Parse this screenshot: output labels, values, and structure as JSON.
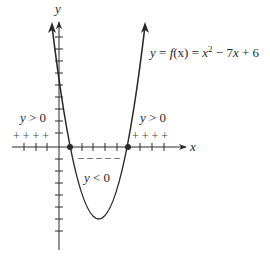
{
  "diagram": {
    "type": "parabola-sign-chart",
    "equation_label": "y = f(x) = x² − 7x + 6",
    "function": {
      "a": 1,
      "b": -7,
      "c": 6
    },
    "roots": [
      1,
      6
    ],
    "vertex": {
      "x": 3.5,
      "y": -6.25
    },
    "axes": {
      "x_label": "x",
      "y_label": "y"
    },
    "regions": [
      {
        "label": "y > 0",
        "where": "x < 1",
        "marks": "+ + + +"
      },
      {
        "label": "y < 0",
        "where": "1 < x < 6",
        "marks": "– – – – –"
      },
      {
        "label": "y > 0",
        "where": "x > 6",
        "marks": "+ + + +"
      }
    ],
    "colors": {
      "curve": "#2a2a2a",
      "axis": "#2a2a2a"
    }
  },
  "labels": {
    "y_axis": "y",
    "x_axis": "x",
    "equation_prefix": "y = ",
    "equation_f": "f",
    "equation_fx": "(x)",
    "equation_eq": " = ",
    "equation_x": "x",
    "equation_exp": "2",
    "equation_rest": " − 7",
    "equation_x2": "x",
    "equation_tail": " + 6",
    "left_positive": "y > 0",
    "right_positive": "y > 0",
    "negative": "y < 0",
    "y_char": "y",
    "left_pos_op": " > 0",
    "right_pos_op": " > 0",
    "neg_op": " < 0",
    "plus_left": "+ + + +",
    "plus_right": "+ + + +",
    "minus_mid": "– – – – –"
  }
}
